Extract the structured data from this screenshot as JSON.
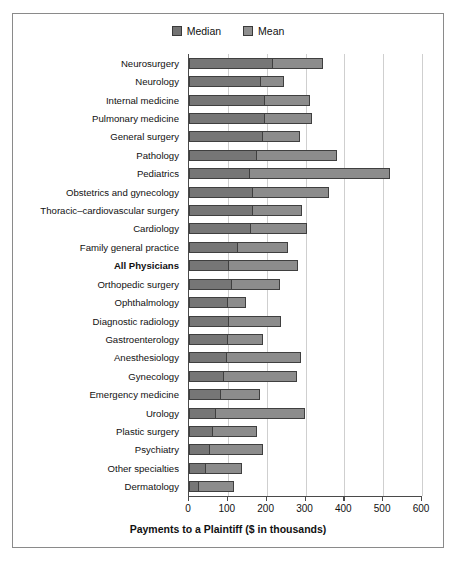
{
  "chart_data": {
    "type": "bar",
    "title": "",
    "xlabel": "Payments to a Plaintiff ($ in thousands)",
    "ylabel": "",
    "xlim": [
      0,
      600
    ],
    "xticks": [
      0,
      100,
      200,
      300,
      400,
      500,
      600
    ],
    "grid": true,
    "legend_position": "top-center",
    "orientation": "horizontal",
    "note": "Each row is a single bar drawn from 0 to the Mean value; the darker inner segment spans 0 to the Median value.",
    "legend": [
      {
        "label": "Median",
        "color": "#767676"
      },
      {
        "label": "Mean",
        "color": "#8c8c8c"
      }
    ],
    "categories": [
      "Neurosurgery",
      "Neurology",
      "Internal medicine",
      "Pulmonary medicine",
      "General surgery",
      "Pathology",
      "Pediatrics",
      "Obstetrics and gynecology",
      "Thoracic–cardiovascular surgery",
      "Cardiology",
      "Family general practice",
      "All Physicians",
      "Orthopedic surgery",
      "Ophthalmology",
      "Diagnostic radiology",
      "Gastroenterology",
      "Anesthesiology",
      "Gynecology",
      "Emergency medicine",
      "Urology",
      "Plastic surgery",
      "Psychiatry",
      "Other specialties",
      "Dermatology"
    ],
    "series": [
      {
        "name": "Median",
        "values": [
          216,
          185,
          195,
          195,
          190,
          175,
          157,
          165,
          165,
          160,
          125,
          103,
          110,
          100,
          103,
          100,
          98,
          90,
          82,
          70,
          62,
          55,
          45,
          25
        ]
      },
      {
        "name": "Mean",
        "values": [
          344,
          245,
          312,
          318,
          287,
          380,
          517,
          360,
          292,
          305,
          255,
          280,
          235,
          148,
          238,
          190,
          288,
          277,
          182,
          298,
          175,
          190,
          137,
          115
        ]
      }
    ],
    "bold_categories": [
      "All Physicians"
    ]
  }
}
